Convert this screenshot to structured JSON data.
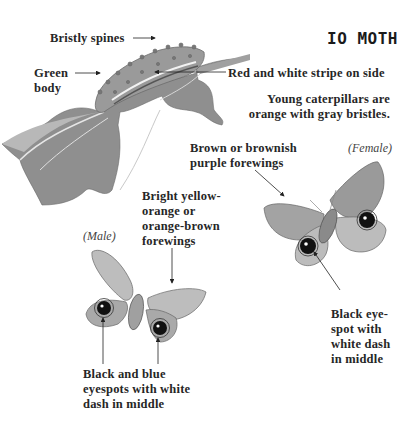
{
  "title": "IO MOTH",
  "caterpillar": {
    "labels": {
      "bristly_spines": "Bristly spines",
      "green_body_line1": "Green",
      "green_body_line2": "body",
      "stripe": "Red and white stripe on side"
    },
    "note_line1": "Young caterpillars are",
    "note_line2": "orange with gray bristles."
  },
  "female": {
    "tag": "(Female)",
    "forewings_line1": "Brown or brownish",
    "forewings_line2": "purple forewings",
    "eyespot_line1": "Black eye-",
    "eyespot_line2": "spot with",
    "eyespot_line3": "white dash",
    "eyespot_line4": "in middle"
  },
  "male": {
    "tag": "(Male)",
    "forewings_line1": "Bright yellow-",
    "forewings_line2": "orange or",
    "forewings_line3": "orange-brown",
    "forewings_line4": "forewings",
    "eyespots_line1": "Black and blue",
    "eyespots_line2": "eyespots with white",
    "eyespots_line3": "dash in middle"
  },
  "colors": {
    "ink": "#222222",
    "leaf": "#8c8c8c",
    "leaf_light": "#b5b5b5",
    "body": "#9a9a9a",
    "wing": "#a8a8a8",
    "wing_light": "#c8c8c8",
    "eyespot": "#111111"
  }
}
